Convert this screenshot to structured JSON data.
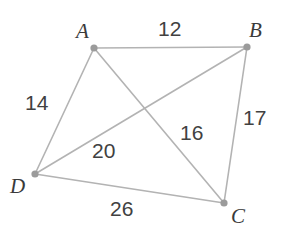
{
  "figure": {
    "type": "geometry-quadrilateral-with-diagonals",
    "background_color": "#ffffff",
    "line_color": "#b3b3b3",
    "vertex_color": "#9b9b9b",
    "text_color": "#3a3a3a"
  },
  "vertices": [
    {
      "id": "A",
      "label": "A",
      "x": 94,
      "y": 48,
      "label_x": 76,
      "label_y": 21
    },
    {
      "id": "B",
      "label": "B",
      "x": 247,
      "y": 47,
      "label_x": 249,
      "label_y": 20
    },
    {
      "id": "C",
      "label": "C",
      "x": 224,
      "y": 203,
      "label_x": 231,
      "label_y": 206
    },
    {
      "id": "D",
      "label": "D",
      "x": 35,
      "y": 174,
      "label_x": 10,
      "label_y": 176
    }
  ],
  "edges": [
    {
      "id": "AB",
      "from": "A",
      "to": "B",
      "kind": "side",
      "length": "12"
    },
    {
      "id": "BC",
      "from": "B",
      "to": "C",
      "kind": "side",
      "length": "17"
    },
    {
      "id": "CD",
      "from": "C",
      "to": "D",
      "kind": "side",
      "length": "26"
    },
    {
      "id": "DA",
      "from": "D",
      "to": "A",
      "kind": "side",
      "length": "14"
    },
    {
      "id": "AC",
      "from": "A",
      "to": "C",
      "kind": "diagonal",
      "length": "16"
    },
    {
      "id": "DB",
      "from": "D",
      "to": "B",
      "kind": "diagonal",
      "length": "20"
    }
  ],
  "length_labels": [
    {
      "id": "AB",
      "text": "12",
      "x": 158,
      "y": 18
    },
    {
      "id": "DA",
      "text": "14",
      "x": 25,
      "y": 92
    },
    {
      "id": "BC",
      "text": "17",
      "x": 243,
      "y": 107
    },
    {
      "id": "AC",
      "text": "16",
      "x": 180,
      "y": 122
    },
    {
      "id": "DB",
      "text": "20",
      "x": 92,
      "y": 140
    },
    {
      "id": "CD",
      "text": "26",
      "x": 110,
      "y": 198
    }
  ]
}
